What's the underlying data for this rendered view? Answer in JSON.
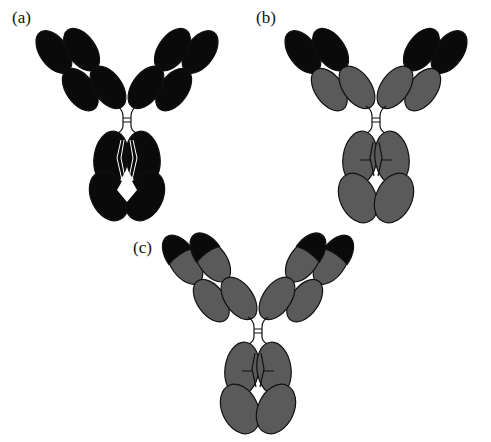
{
  "figure": {
    "panels": [
      {
        "id": "a",
        "label": "(a)",
        "description": "Fully black antibody (all domains dark)",
        "variable_fill": "#0a0a0a",
        "constant_fill": "#0a0a0a",
        "tip_fill": "#0a0a0a"
      },
      {
        "id": "b",
        "label": "(b)",
        "description": "Chimeric antibody: variable domains black, constant domains gray",
        "variable_fill": "#0a0a0a",
        "constant_fill": "#5a5a5a",
        "tip_fill": "#0a0a0a"
      },
      {
        "id": "c",
        "label": "(c)",
        "description": "Humanized antibody: only CDR tips black, rest gray",
        "variable_fill": "#5a5a5a",
        "constant_fill": "#5a5a5a",
        "tip_fill": "#0a0a0a"
      }
    ],
    "colors": {
      "background": "#ffffff",
      "dark": "#0a0a0a",
      "gray": "#5a5a5a",
      "outline": "#111111"
    }
  }
}
